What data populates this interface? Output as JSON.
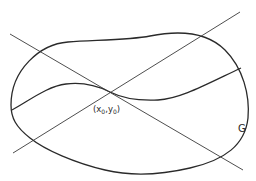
{
  "diagram": {
    "type": "geometric-figure",
    "labels": {
      "point": {
        "x_base": "x",
        "x_sub": "0",
        "y_base": "y",
        "y_sub": "0"
      },
      "region": "G"
    },
    "colors": {
      "stroke": "#2a2a2a",
      "background": "#ffffff"
    },
    "elements": [
      {
        "name": "region-boundary",
        "kind": "closed-curve",
        "label": "G"
      },
      {
        "name": "solution-curve",
        "kind": "open-curve",
        "passes_through": "(x0,y0)"
      },
      {
        "name": "line-descending",
        "kind": "straight-line"
      },
      {
        "name": "line-ascending",
        "kind": "straight-line"
      }
    ]
  }
}
